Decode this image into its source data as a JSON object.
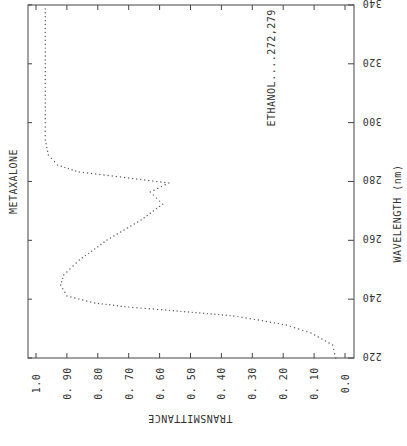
{
  "chart_data": {
    "type": "line",
    "title": "METAXALONE",
    "annotation": "ETHANOL....272,279",
    "xlabel": "WAVELENGTH (nm)",
    "ylabel": "TRANSMITTANCE",
    "orientation": "rotated 90 degrees (wavelength on vertical right axis, transmittance on horizontal bottom axis, reversed)",
    "xlim": [
      220,
      340
    ],
    "ylim": [
      0.0,
      1.0
    ],
    "x_ticks": [
      220,
      240,
      260,
      280,
      300,
      320,
      340
    ],
    "y_ticks": [
      "1.0",
      "0.90",
      "0.80",
      "0.70",
      "0.60",
      "0.50",
      "0.40",
      "0.30",
      "0.20",
      "0.10",
      "0.0"
    ],
    "grid": false,
    "line_style": "dotted",
    "series": [
      {
        "name": "Metaxalone in ethanol",
        "x": [
          220,
          224.4,
          228.5,
          231.2,
          232.9,
          234.3,
          235.3,
          236.3,
          237.3,
          238.7,
          241.1,
          244.8,
          248.2,
          253.3,
          260.1,
          266.9,
          272.3,
          276.4,
          279.5,
          281.2,
          283.2,
          285.6,
          289.0,
          294.1,
          300,
          320,
          340
        ],
        "values": [
          0.03,
          0.04,
          0.11,
          0.19,
          0.28,
          0.36,
          0.47,
          0.58,
          0.7,
          0.81,
          0.9,
          0.92,
          0.91,
          0.86,
          0.77,
          0.66,
          0.59,
          0.63,
          0.57,
          0.7,
          0.86,
          0.93,
          0.96,
          0.97,
          0.97,
          0.97,
          0.97
        ]
      }
    ]
  },
  "labels": {
    "title": "METAXALONE",
    "annotation": "ETHANOL....272,279",
    "wavelength_axis": "WAVELENGTH (nm)",
    "transmittance_axis": "TRANSMITTANCE"
  }
}
